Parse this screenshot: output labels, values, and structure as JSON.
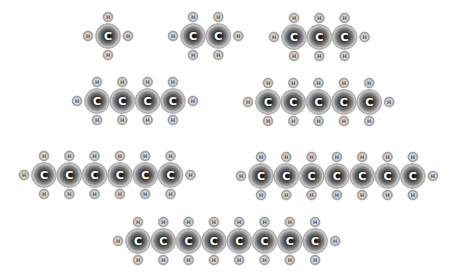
{
  "diagram": {
    "title": "",
    "colors": {
      "background": "#ffffff",
      "carbon_outer": "#d8d8d8",
      "carbon_mid": "#8a8a8a",
      "carbon_core": "#1e1e1e",
      "carbon_label": "#ffffff",
      "hydrogen_outer": "#b4b4b4",
      "hydrogen_inner": "#ececec",
      "hydrogen_label": "#555555"
    },
    "labels": {
      "carbon": "C",
      "hydrogen": "H"
    },
    "molecules": [
      {
        "name": "methane",
        "carbons": 1
      },
      {
        "name": "ethane",
        "carbons": 2
      },
      {
        "name": "propane",
        "carbons": 3
      },
      {
        "name": "butane",
        "carbons": 4
      },
      {
        "name": "pentane",
        "carbons": 5
      },
      {
        "name": "hexane",
        "carbons": 6
      },
      {
        "name": "heptane",
        "carbons": 7
      },
      {
        "name": "octane",
        "carbons": 8
      }
    ]
  }
}
